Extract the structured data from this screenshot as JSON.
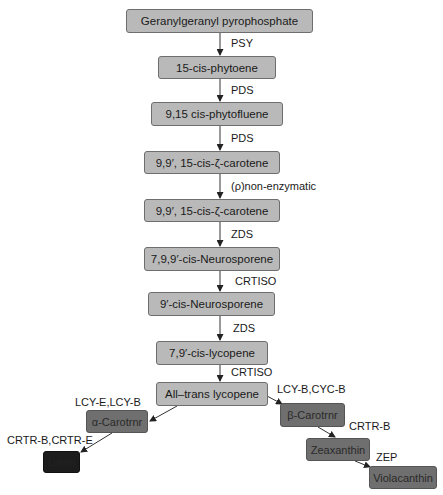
{
  "diagram": {
    "type": "biosynthetic-pathway-flowchart",
    "nodes": [
      {
        "id": "ggpp",
        "label": "Geranylgeranyl pyrophosphate"
      },
      {
        "id": "phytoene",
        "label": "15-cis-phytoene"
      },
      {
        "id": "phytofluene",
        "label": "9,15 cis-phytofluene"
      },
      {
        "id": "zeta1",
        "label": "9,9′, 15-cis-ζ-carotene"
      },
      {
        "id": "zeta2",
        "label": "9,9′, 15-cis-ζ-carotene"
      },
      {
        "id": "neuro1",
        "label": "7,9,9′-cis-Neurosporene"
      },
      {
        "id": "neuro2",
        "label": "9′-cis-Neurosporene"
      },
      {
        "id": "lyco_cis",
        "label": "7,9′-cis-lycopene"
      },
      {
        "id": "lyco_trans",
        "label": "All–trans lycopene"
      },
      {
        "id": "alpha",
        "label": "α-Carotrnr"
      },
      {
        "id": "lutein",
        "label": "Lutein"
      },
      {
        "id": "beta",
        "label": "β-Carotrnr"
      },
      {
        "id": "zea",
        "label": "Zeaxanthin"
      },
      {
        "id": "viola",
        "label": "Violacanthin"
      }
    ],
    "edges": [
      {
        "from": "ggpp",
        "to": "phytoene",
        "label": "PSY"
      },
      {
        "from": "phytoene",
        "to": "phytofluene",
        "label": "PDS"
      },
      {
        "from": "phytofluene",
        "to": "zeta1",
        "label": "PDS"
      },
      {
        "from": "zeta1",
        "to": "zeta2",
        "label": "(ρ)non-enzymatic"
      },
      {
        "from": "zeta2",
        "to": "neuro1",
        "label": "ZDS"
      },
      {
        "from": "neuro1",
        "to": "neuro2",
        "label": "CRTISO"
      },
      {
        "from": "neuro2",
        "to": "lyco_cis",
        "label": "ZDS"
      },
      {
        "from": "lyco_cis",
        "to": "lyco_trans",
        "label": "CRTISO"
      },
      {
        "from": "lyco_trans",
        "to": "alpha",
        "label": "LCY-E,LCY-B"
      },
      {
        "from": "alpha",
        "to": "lutein",
        "label": "CRTR-B,CRTR-E"
      },
      {
        "from": "lyco_trans",
        "to": "beta",
        "label": "LCY-B,CYC-B"
      },
      {
        "from": "beta",
        "to": "zea",
        "label": "CRTR-B"
      },
      {
        "from": "zea",
        "to": "viola",
        "label": "ZEP"
      }
    ]
  }
}
